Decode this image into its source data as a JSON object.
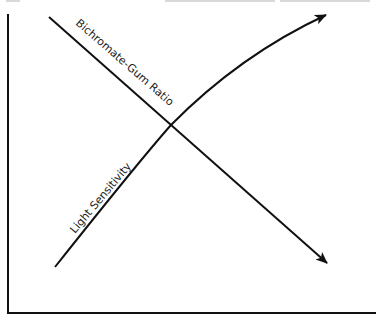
{
  "diagram": {
    "type": "crossing-trend-diagram",
    "axes": {
      "x_label": "",
      "y_label": "",
      "ticks": false
    },
    "series": [
      {
        "id": "light-sensitivity",
        "label": "Light Sensitivity",
        "trend": "increasing",
        "shape": "curved-concave",
        "arrowhead": "end"
      },
      {
        "id": "bichromate-gum-ratio",
        "label": "Bichromate-Gum Ratio",
        "trend": "decreasing",
        "shape": "straight",
        "arrowhead": "end"
      }
    ],
    "intersection": true
  },
  "colors": {
    "ink": "#111111",
    "background": "#ffffff"
  }
}
